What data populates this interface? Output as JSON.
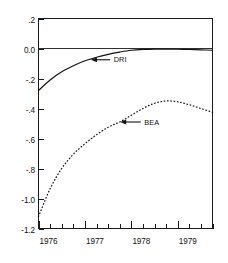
{
  "chart_data": {
    "type": "line",
    "title": "",
    "subtitle": "",
    "xlabel": "",
    "ylabel": "",
    "xlim": [
      1976.0,
      1979.75
    ],
    "ylim": [
      -1.2,
      0.2
    ],
    "grid": false,
    "legend_position": "inline-annotations",
    "y_ticks": [
      0.2,
      0.0,
      -0.2,
      -0.4,
      -0.6,
      -0.8,
      -1.0,
      -1.2
    ],
    "y_tick_labels": [
      ".2",
      "0.0",
      "-.2",
      "-.4",
      "-.6",
      "-.8",
      "-1.0",
      "-1.2"
    ],
    "x_ticks": [
      1976.0,
      1976.25,
      1976.5,
      1976.75,
      1977.0,
      1977.25,
      1977.5,
      1977.75,
      1978.0,
      1978.25,
      1978.5,
      1978.75,
      1979.0,
      1979.25,
      1979.5,
      1979.75
    ],
    "x_major_ticks": [
      1976.0,
      1977.0,
      1978.0,
      1979.0
    ],
    "x_tick_labels": [
      "1976",
      "1977",
      "1978",
      "1979"
    ],
    "zero_reference_line": 0.0,
    "series": [
      {
        "name": "DRI",
        "style": "solid",
        "x": [
          1976.0,
          1976.25,
          1976.5,
          1976.75,
          1977.0,
          1977.25,
          1977.5,
          1977.75,
          1978.0,
          1978.25,
          1978.5,
          1978.75,
          1979.0,
          1979.25,
          1979.5,
          1979.75
        ],
        "values": [
          -0.28,
          -0.21,
          -0.155,
          -0.115,
          -0.082,
          -0.058,
          -0.039,
          -0.024,
          -0.012,
          -0.006,
          -0.004,
          -0.004,
          -0.005,
          -0.007,
          -0.009,
          -0.012
        ]
      },
      {
        "name": "BEA",
        "style": "dotted",
        "x": [
          1976.0,
          1976.25,
          1976.5,
          1976.75,
          1977.0,
          1977.25,
          1977.5,
          1977.75,
          1978.0,
          1978.25,
          1978.5,
          1978.75,
          1979.0,
          1979.25,
          1979.5,
          1979.75
        ],
        "values": [
          -1.12,
          -0.935,
          -0.8,
          -0.705,
          -0.635,
          -0.575,
          -0.525,
          -0.49,
          -0.445,
          -0.4,
          -0.365,
          -0.35,
          -0.355,
          -0.375,
          -0.4,
          -0.425
        ]
      }
    ],
    "annotations": [
      {
        "label": "DRI",
        "arrow": "left",
        "target_x": 1977.12,
        "target_y": -0.075,
        "label_x": 1977.62,
        "label_y": -0.075
      },
      {
        "label": "BEA",
        "arrow": "left",
        "target_x": 1977.75,
        "target_y": -0.49,
        "label_x": 1978.28,
        "label_y": -0.49
      }
    ]
  }
}
